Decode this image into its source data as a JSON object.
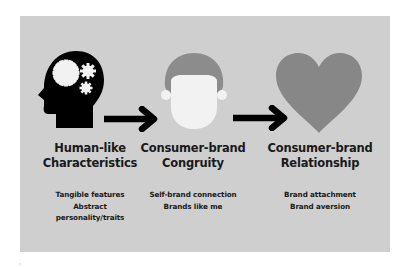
{
  "diagram": {
    "type": "flow",
    "direction": "left-to-right",
    "colors": {
      "background": "#ffffff",
      "panel": "#cfcfcf",
      "text": "#1a1a1a",
      "arrow": "#000000",
      "head_icon": "#000000",
      "gear": "#f2f2f2",
      "hair": "#8c8c8c",
      "face": "#f2f2f2",
      "heart": "#878787"
    },
    "stages": [
      {
        "icon": "head-with-gears-icon",
        "title_lines": [
          "Human-like",
          "Characteristics"
        ],
        "items": [
          "Tangible features",
          "Abstract",
          "personality/traits"
        ]
      },
      {
        "icon": "person-face-icon",
        "title_lines": [
          "Consumer-brand",
          "Congruity"
        ],
        "items": [
          "Self-brand connection",
          "Brands like me"
        ]
      },
      {
        "icon": "heart-icon",
        "title_lines": [
          "Consumer-brand",
          "Relationship"
        ],
        "items": [
          "Brand attachment",
          "Brand aversion"
        ]
      }
    ],
    "connectors": [
      {
        "from": 0,
        "to": 1,
        "icon": "right-arrow-icon"
      },
      {
        "from": 1,
        "to": 2,
        "icon": "right-arrow-icon"
      }
    ]
  }
}
